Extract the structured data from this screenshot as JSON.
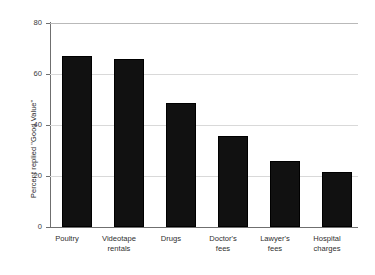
{
  "chart_data": {
    "type": "bar",
    "title": "",
    "xlabel": "",
    "ylabel": "Percent replied \"Good Value\"",
    "categories": [
      "Poultry",
      "Videotape\nrentals",
      "Drugs",
      "Doctor's\nfees",
      "Lawyer's\nfees",
      "Hospital\ncharges"
    ],
    "values": [
      67,
      66,
      48.5,
      35.5,
      26,
      21.5
    ],
    "ylim": [
      0,
      80
    ],
    "yticks": [
      0,
      20,
      40,
      60,
      80
    ],
    "ytick_labels": [
      "0",
      "20",
      "40",
      "60",
      "80"
    ],
    "grid": true,
    "legend": false,
    "bar_color": "#111111",
    "grid_color": "#d9d9d9",
    "axis_color": "#6f6f6f"
  },
  "ticks": {
    "t0": "0",
    "t20": "20",
    "t40": "40",
    "t60": "60",
    "t80": "80"
  },
  "categories": {
    "c0": "Poultry",
    "c1": "Videotape\nrentals",
    "c2": "Drugs",
    "c3": "Doctor's\nfees",
    "c4": "Lawyer's\nfees",
    "c5": "Hospital\ncharges"
  },
  "axis": {
    "ylabel": "Percent replied \"Good Value\""
  }
}
